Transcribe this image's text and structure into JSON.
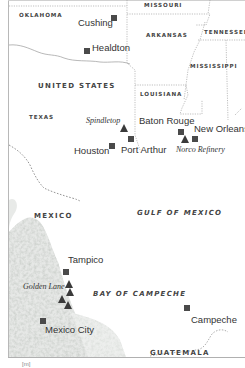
{
  "map": {
    "colors": {
      "marker": "#4a4a4a",
      "border_line": "#9a9a9a",
      "terrain": "#cfd3cf",
      "frame": "#b0b0b0"
    },
    "regions": [
      {
        "id": "oklahoma",
        "label": "OKLAHOMA",
        "x": 19,
        "y": 13
      },
      {
        "id": "missouri",
        "label": "MISSOURI",
        "x": 144,
        "y": 3
      },
      {
        "id": "arkansas",
        "label": "ARKANSAS",
        "x": 146,
        "y": 33
      },
      {
        "id": "tennessee",
        "label": "TENNESSEE",
        "x": 204,
        "y": 30
      },
      {
        "id": "mississippi",
        "label": "MISSISSIPPI",
        "x": 190,
        "y": 64
      },
      {
        "id": "louisiana",
        "label": "LOUISIANA",
        "x": 140,
        "y": 92
      },
      {
        "id": "texas",
        "label": "TEXAS",
        "x": 29,
        "y": 115
      }
    ],
    "countries": [
      {
        "id": "united-states",
        "label": "UNITED STATES",
        "x": 38,
        "y": 83
      },
      {
        "id": "mexico",
        "label": "MEXICO",
        "x": 34,
        "y": 213
      },
      {
        "id": "guatemala",
        "label": "GUATEMALA",
        "x": 150,
        "y": 350
      }
    ],
    "waters": [
      {
        "id": "gulf-of-mexico",
        "label": "GULF OF MEXICO",
        "x": 137,
        "y": 210
      },
      {
        "id": "bay-of-campeche",
        "label": "BAY OF CAMPECHE",
        "x": 93,
        "y": 291
      }
    ],
    "cities": [
      {
        "id": "cushing",
        "label": "Cushing",
        "x": 78,
        "y": 18,
        "mx": 110,
        "my": 18
      },
      {
        "id": "healdton",
        "label": "Healdton",
        "x": 92,
        "y": 43,
        "mx": 84,
        "my": 48
      },
      {
        "id": "baton-rouge",
        "label": "Baton Rouge",
        "x": 139,
        "y": 116
      },
      {
        "id": "new-orleans",
        "label": "New Orleans",
        "x": 194,
        "y": 124
      },
      {
        "id": "houston",
        "label": "Houston",
        "x": 74,
        "y": 146,
        "mx": 109,
        "my": 143
      },
      {
        "id": "port-arthur",
        "label": "Port Arthur",
        "x": 121,
        "y": 145
      },
      {
        "id": "tampico",
        "label": "Tampico",
        "x": 68,
        "y": 264
      },
      {
        "id": "mexico-city",
        "label": "Mexico City",
        "x": 45,
        "y": 325
      },
      {
        "id": "campeche",
        "label": "Campeche",
        "x": 191,
        "y": 315
      }
    ],
    "city_markers": [
      {
        "id": "cushing-marker",
        "x": 111,
        "y": 15
      },
      {
        "id": "healdton-marker",
        "x": 84,
        "y": 48
      },
      {
        "id": "baton-rouge-marker",
        "x": 178,
        "y": 129
      },
      {
        "id": "new-orleans-marker",
        "x": 192,
        "y": 136
      },
      {
        "id": "houston-marker",
        "x": 109,
        "y": 143
      },
      {
        "id": "port-arthur-marker",
        "x": 128,
        "y": 136
      },
      {
        "id": "tampico-marker",
        "x": 63,
        "y": 269
      },
      {
        "id": "mexico-city-marker",
        "x": 40,
        "y": 318
      },
      {
        "id": "campeche-marker",
        "x": 184,
        "y": 305
      }
    ],
    "oil_sites": [
      {
        "id": "spindletop",
        "label": "Spindletop",
        "x": 86,
        "y": 117
      },
      {
        "id": "norco-refinery",
        "label": "Norco Refinery",
        "x": 176,
        "y": 146
      },
      {
        "id": "golden-lane",
        "label": "Golden Lane",
        "x": 23,
        "y": 283
      }
    ],
    "oil_markers": [
      {
        "id": "spindletop-marker",
        "x": 120,
        "y": 124
      },
      {
        "id": "norco-marker",
        "x": 181,
        "y": 135
      },
      {
        "id": "golden-lane-marker-1",
        "x": 65,
        "y": 280
      },
      {
        "id": "golden-lane-marker-2",
        "x": 65,
        "y": 289
      },
      {
        "id": "golden-lane-marker-3",
        "x": 58,
        "y": 296
      },
      {
        "id": "golden-lane-marker-4",
        "x": 64,
        "y": 302
      }
    ],
    "caption": "[m]"
  }
}
